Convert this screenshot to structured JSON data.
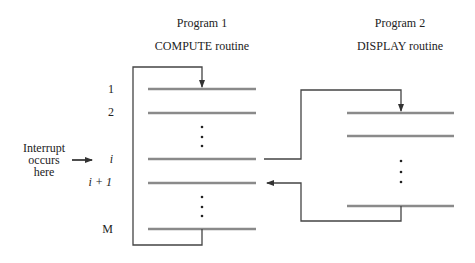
{
  "program1": {
    "title": "Program 1",
    "routine": "COMPUTE routine",
    "instruction_labels": {
      "first": "1",
      "second": "2",
      "interrupted": "i",
      "next": "i + 1",
      "last": "M"
    }
  },
  "program2": {
    "title": "Program 2",
    "routine": "DISPLAY routine"
  },
  "interrupt": {
    "label_line1": "Interrupt",
    "label_line2": "occurs",
    "label_line3": "here"
  },
  "colors": {
    "instruction_line": "#8a8a8a",
    "connector": "#444444",
    "text": "#222222"
  }
}
